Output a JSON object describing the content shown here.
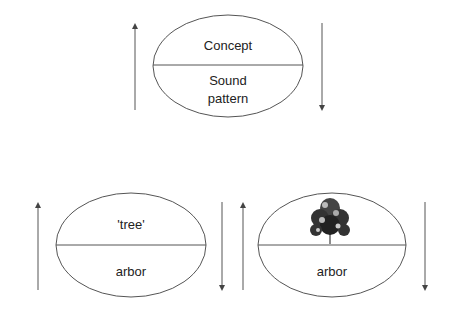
{
  "top_sign": {
    "signified": "Concept",
    "signifier_line1": "Sound",
    "signifier_line2": "pattern"
  },
  "bottom_left_sign": {
    "signified": "'tree'",
    "signifier": "arbor"
  },
  "bottom_right_sign": {
    "signified_image": "tree-image",
    "signifier": "arbor"
  },
  "colors": {
    "line": "#555555",
    "text": "#222222"
  }
}
